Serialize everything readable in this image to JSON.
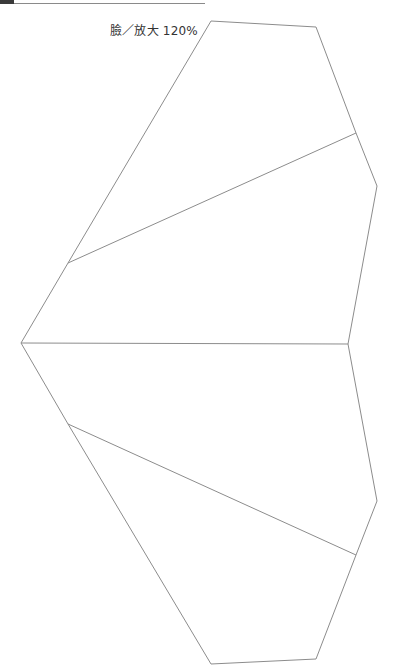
{
  "diagram": {
    "label": "臉／放大 120%",
    "stroke_color": "#8c8c8c",
    "header_dark_color": "#3a3a3a",
    "outline_points": [
      [
        211,
        21
      ],
      [
        316,
        27
      ],
      [
        356,
        133
      ],
      [
        377,
        186
      ],
      [
        348,
        344
      ],
      [
        377,
        501
      ],
      [
        356,
        555
      ],
      [
        316,
        659
      ],
      [
        211,
        664
      ],
      [
        68,
        424
      ],
      [
        21,
        343
      ],
      [
        68,
        263
      ]
    ],
    "inner_lines": [
      {
        "from": [
          68,
          263
        ],
        "to": [
          356,
          133
        ]
      },
      {
        "from": [
          21,
          343
        ],
        "to": [
          348,
          344
        ]
      },
      {
        "from": [
          68,
          424
        ],
        "to": [
          356,
          555
        ]
      }
    ]
  }
}
